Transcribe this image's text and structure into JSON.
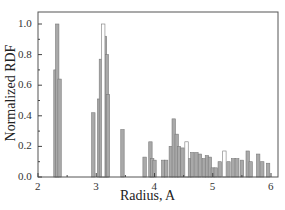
{
  "chart_data": {
    "type": "bar",
    "title": "",
    "xlabel": "Radius, A",
    "ylabel": "Normalized RDF",
    "xlim": [
      2,
      6
    ],
    "ylim": [
      0.0,
      1.05
    ],
    "xticks": [
      "2",
      "3",
      "4",
      "5",
      "6"
    ],
    "yticks": [
      "0.0",
      "0.2",
      "0.4",
      "0.6",
      "0.8",
      "1.0"
    ],
    "grid": false,
    "legend": null,
    "series": [
      {
        "name": "filled",
        "color": "#a9a9a9",
        "x": [
          2.3,
          2.33,
          2.37,
          2.95,
          3.05,
          3.08,
          3.15,
          3.18,
          3.2,
          3.45,
          3.83,
          3.93,
          3.96,
          4.0,
          4.15,
          4.2,
          4.28,
          4.33,
          4.38,
          4.42,
          4.48,
          4.6,
          4.65,
          4.72,
          4.78,
          4.85,
          4.9,
          4.95,
          5.0,
          5.05,
          5.12,
          5.27,
          5.35,
          5.42,
          5.5,
          5.6,
          5.65,
          5.78,
          5.85,
          5.95
        ],
        "values": [
          0.7,
          1.0,
          0.64,
          0.42,
          0.51,
          0.77,
          0.92,
          0.8,
          0.54,
          0.31,
          0.13,
          0.23,
          0.12,
          0.11,
          0.11,
          0.11,
          0.2,
          0.38,
          0.28,
          0.2,
          0.19,
          0.12,
          0.16,
          0.16,
          0.15,
          0.12,
          0.14,
          0.13,
          0.06,
          0.06,
          0.1,
          0.1,
          0.12,
          0.12,
          0.11,
          0.17,
          0.1,
          0.15,
          0.1,
          0.09
        ]
      },
      {
        "name": "open",
        "color": "#ffffff",
        "x": [
          3.12,
          4.55,
          5.2
        ],
        "values": [
          1.0,
          0.23,
          0.17
        ]
      }
    ]
  }
}
